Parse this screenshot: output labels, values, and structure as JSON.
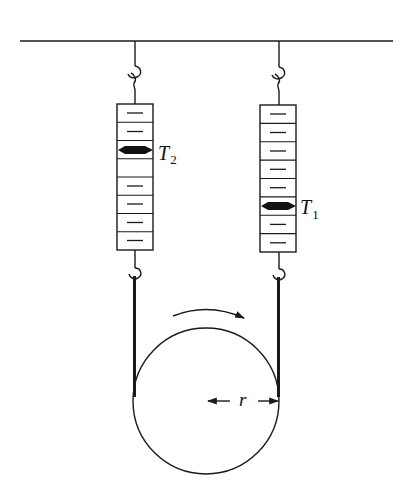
{
  "diagram": {
    "type": "physics-pulley-belt-friction",
    "colors": {
      "ink": "#1a1a1a",
      "background": "#ffffff"
    },
    "ceiling": {
      "x1": 20,
      "x2": 393,
      "y": 41
    },
    "scales": [
      {
        "id": "left",
        "label": "T",
        "subscript": "2",
        "string_x": 135,
        "box": {
          "x": 117,
          "y": 104,
          "width": 36,
          "height": 146
        },
        "segments": 8,
        "pointer_segment": 3,
        "label_pos": {
          "x": 158,
          "y": 160
        }
      },
      {
        "id": "right",
        "label": "T",
        "subscript": "1",
        "string_x": 279,
        "box": {
          "x": 260,
          "y": 105,
          "width": 36,
          "height": 147
        },
        "segments": 8,
        "pointer_segment": 6,
        "label_pos": {
          "x": 300,
          "y": 214
        }
      }
    ],
    "wheel": {
      "cx": 206,
      "cy": 401,
      "r": 73
    },
    "rotation_arrow": {
      "direction": "clockwise"
    },
    "radius_label": "r"
  }
}
